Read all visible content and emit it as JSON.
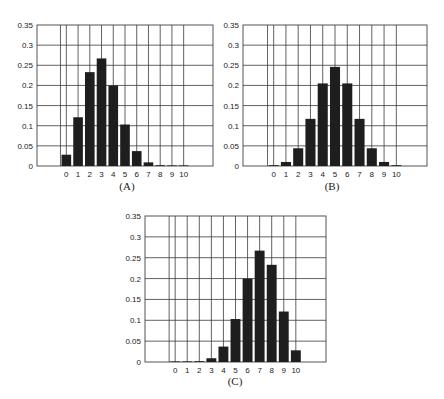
{
  "figure": {
    "panels": [
      "(A)",
      "(B)",
      "(C)"
    ]
  },
  "colors": {
    "bar": "#1e1e1e",
    "grid": "#3a3a3a",
    "frame": "#555555",
    "text": "#222222"
  },
  "chart_data": [
    {
      "type": "bar",
      "label": "(A)",
      "title": "",
      "xlabel": "",
      "ylabel": "",
      "categories": [
        "0",
        "1",
        "2",
        "3",
        "4",
        "5",
        "6",
        "7",
        "8",
        "9",
        "10"
      ],
      "values": [
        0.028,
        0.121,
        0.233,
        0.267,
        0.2,
        0.103,
        0.037,
        0.009,
        0.001,
        0.0,
        0.0
      ],
      "ylim": [
        0,
        0.35
      ],
      "yticks": [
        "0",
        "0.05",
        "0.1",
        "0.15",
        "0.2",
        "0.25",
        "0.3",
        "0.35"
      ],
      "grid": true
    },
    {
      "type": "bar",
      "label": "(B)",
      "title": "",
      "xlabel": "",
      "ylabel": "",
      "categories": [
        "0",
        "1",
        "2",
        "3",
        "4",
        "5",
        "6",
        "7",
        "8",
        "9",
        "10"
      ],
      "values": [
        0.001,
        0.01,
        0.044,
        0.117,
        0.205,
        0.246,
        0.205,
        0.117,
        0.044,
        0.01,
        0.001
      ],
      "ylim": [
        0,
        0.35
      ],
      "yticks": [
        "0",
        "0.05",
        "0.1",
        "0.15",
        "0.2",
        "0.25",
        "0.3",
        "0.35"
      ],
      "grid": true
    },
    {
      "type": "bar",
      "label": "(C)",
      "title": "",
      "xlabel": "",
      "ylabel": "",
      "categories": [
        "0",
        "1",
        "2",
        "3",
        "4",
        "5",
        "6",
        "7",
        "8",
        "9",
        "10"
      ],
      "values": [
        0.0,
        0.0,
        0.001,
        0.009,
        0.037,
        0.103,
        0.2,
        0.267,
        0.233,
        0.121,
        0.028
      ],
      "ylim": [
        0,
        0.35
      ],
      "yticks": [
        "0",
        "0.05",
        "0.1",
        "0.15",
        "0.2",
        "0.25",
        "0.3",
        "0.35"
      ],
      "grid": true
    }
  ]
}
